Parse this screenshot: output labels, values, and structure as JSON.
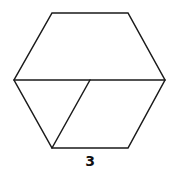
{
  "figure": {
    "shape": "hexagon",
    "label": "3",
    "line_color": "#1a1a1a",
    "background": "#ffffff"
  }
}
